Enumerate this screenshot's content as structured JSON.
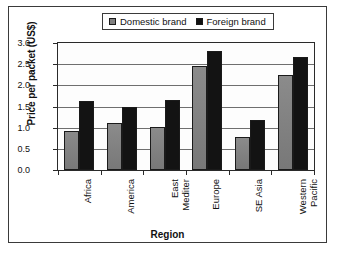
{
  "chart_data": {
    "type": "bar",
    "title": "",
    "xlabel": "Region",
    "ylabel": "Price per packet (US$)",
    "ylim": [
      0,
      3.0
    ],
    "ytick_labels": [
      "0.0",
      "0.5",
      "1.0",
      "1.5",
      "2.0",
      "2.5",
      "3.0"
    ],
    "ytick_values": [
      0.0,
      0.5,
      1.0,
      1.5,
      2.0,
      2.5,
      3.0
    ],
    "grid": "horizontal",
    "legend_position": "top-center",
    "categories": [
      "Africa",
      "America",
      "East Mediter",
      "Europe",
      "SE Asia",
      "Western Pacific"
    ],
    "category_lines": [
      [
        "Africa"
      ],
      [
        "America"
      ],
      [
        "East",
        "Mediter"
      ],
      [
        "Europe"
      ],
      [
        "SE Asia"
      ],
      [
        "Western",
        "Pacific"
      ]
    ],
    "series": [
      {
        "name": "Domestic brand",
        "color": "#808080",
        "values": [
          0.92,
          1.1,
          1.01,
          2.46,
          0.78,
          2.25
        ]
      },
      {
        "name": "Foreign brand",
        "color": "#121212",
        "values": [
          1.62,
          1.48,
          1.66,
          2.82,
          1.18,
          2.68
        ]
      }
    ]
  },
  "legend": {
    "entries": [
      {
        "label": "Domestic brand",
        "swatch": "domestic-swatch-icon"
      },
      {
        "label": "Foreign brand",
        "swatch": "foreign-swatch-icon"
      }
    ]
  }
}
